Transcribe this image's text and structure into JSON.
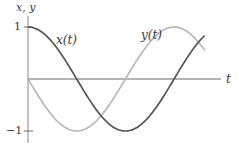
{
  "chart_data": {
    "type": "line",
    "title": "",
    "xlabel": "t",
    "ylabel": "x, y",
    "yticks": [
      1,
      -1
    ],
    "ytick_labels": [
      "1",
      "−1"
    ],
    "xlim": [
      0,
      6.4
    ],
    "ylim": [
      -1,
      1
    ],
    "grid": false,
    "legend": "inline labels",
    "series": [
      {
        "name": "x(t)",
        "label": "x(t)",
        "function": "cos(t)",
        "color": "#555555",
        "x": [
          0,
          0.785,
          1.571,
          2.356,
          3.142,
          3.927,
          4.712,
          5.498,
          5.7
        ],
        "values": [
          1,
          0.71,
          0,
          -0.71,
          -1,
          -0.71,
          0,
          0.71,
          0.83
        ]
      },
      {
        "name": "y(t)",
        "label": "y(t)",
        "function": "-sin(t)",
        "color": "#b8b8b8",
        "x": [
          0,
          0.785,
          1.571,
          2.356,
          3.142,
          3.927,
          4.712,
          5.498,
          5.7
        ],
        "values": [
          0,
          -0.71,
          -1,
          -0.71,
          0,
          0.71,
          1,
          0.71,
          0.55
        ]
      }
    ]
  },
  "labels": {
    "y_axis": "x, y",
    "x_axis": "t",
    "tick_pos": "1",
    "tick_neg": "−1",
    "series_x": "x(t)",
    "series_y": "y(t)"
  },
  "layout": {
    "origin_px": [
      28,
      79
    ],
    "unit_y_px": 52,
    "unit_x_px": 31
  }
}
